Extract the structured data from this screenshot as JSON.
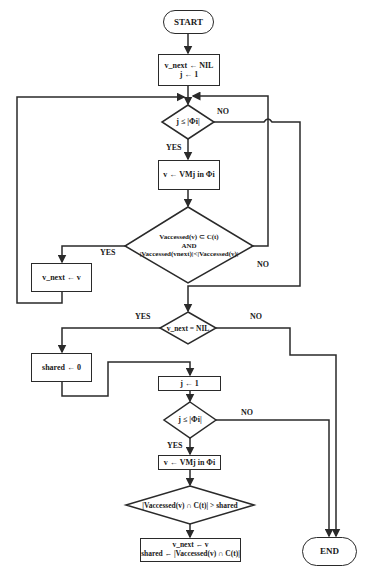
{
  "nodes": {
    "start": "START",
    "init_line1": "v_next ← NIL",
    "init_line2": "j ← 1",
    "cond1": "j ≤ |Φi|",
    "assign1": "v ← VMj in Φi",
    "cond2_line1": "Vaccessed(v) ⊂ C(t)",
    "cond2_line2": "AND",
    "cond2_line3": "|Vaccessed(vnext)|<|Vaccessed(v)|",
    "update_vnext": "v_next ← v",
    "cond_nil": "v_next = NIL",
    "shared_init": "shared ← 0",
    "j_reset": "j ← 1",
    "cond3": "j ≤ |Φi|",
    "assign2": "v ← VMj in Φi",
    "cond4": "|Vaccessed(v) ∩ C(t)| > shared",
    "final_line1": "v_next ← v",
    "final_line2": "shared ← |Vaccessed(v) ∩ C(t)|",
    "end": "END"
  },
  "labels": {
    "yes": "YES",
    "no": "NO"
  },
  "colors": {
    "line": "#2a2a2a",
    "background": "#ffffff"
  }
}
